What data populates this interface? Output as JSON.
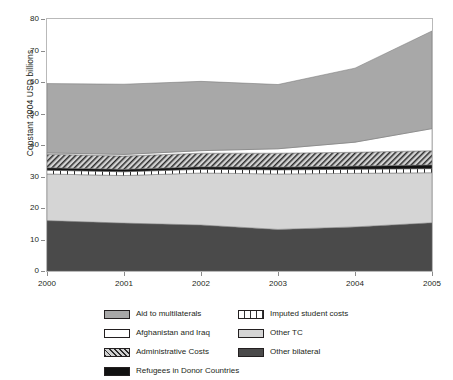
{
  "chart_data": {
    "type": "area",
    "stacked": true,
    "title": "",
    "xlabel": "",
    "ylabel": "Constant 2004 USD billions",
    "x": [
      2000,
      2001,
      2002,
      2003,
      2004,
      2005
    ],
    "xticklabels": [
      "2000",
      "2001",
      "2002",
      "2003",
      "2004",
      "2005"
    ],
    "xlim": [
      2000,
      2005
    ],
    "ylim": [
      0,
      80
    ],
    "yticks": [
      0,
      10,
      20,
      30,
      40,
      50,
      60,
      70,
      80
    ],
    "yticklabels": [
      "0",
      "10",
      "20",
      "30",
      "40",
      "50",
      "60",
      "70",
      "80"
    ],
    "grid": false,
    "legend_position": "bottom",
    "series": [
      {
        "name": "Other bilateral",
        "color": "#4a4a4a",
        "pattern": "solid",
        "values": [
          16.0,
          15.2,
          14.6,
          13.2,
          14.0,
          15.3
        ]
      },
      {
        "name": "Other TC",
        "color": "#d5d5d5",
        "pattern": "solid",
        "values": [
          14.8,
          15.1,
          16.5,
          17.6,
          17.0,
          15.9
        ]
      },
      {
        "name": "Imputed student costs",
        "color": "#ffffff",
        "pattern": "vertical-bars",
        "values": [
          1.2,
          1.2,
          1.2,
          1.3,
          1.3,
          1.3
        ]
      },
      {
        "name": "Refugees in Donor Countries",
        "color": "#111111",
        "pattern": "solid",
        "values": [
          0.8,
          0.8,
          0.8,
          0.9,
          1.0,
          1.2
        ]
      },
      {
        "name": "Administrative Costs",
        "color": "#d0d0d0",
        "pattern": "diagonal-hatch",
        "values": [
          4.3,
          4.2,
          4.3,
          4.4,
          4.4,
          4.5
        ]
      },
      {
        "name": "Afghanistan and Iraq",
        "color": "#ffffff",
        "pattern": "solid",
        "values": [
          0.4,
          0.5,
          0.8,
          1.4,
          3.2,
          7.0
        ]
      },
      {
        "name": "Aid to multilaterals",
        "color": "#a8a8a8",
        "pattern": "solid",
        "values": [
          22.0,
          22.3,
          22.0,
          20.4,
          23.5,
          31.0
        ]
      }
    ],
    "totals": [
      59.5,
      59.3,
      60.2,
      59.2,
      64.4,
      72.2
    ],
    "annotations": []
  },
  "legend": {
    "left_column": [
      {
        "label": "Aid to multilaterals",
        "swatch": "sw-multilaterals"
      },
      {
        "label": "Afghanistan and Iraq",
        "swatch": "sw-afghanistan"
      },
      {
        "label": "Administrative Costs",
        "swatch": "sw-admin"
      },
      {
        "label": "Refugees in Donor Countries",
        "swatch": "sw-refugees"
      }
    ],
    "right_column": [
      {
        "label": "Imputed student costs",
        "swatch": "sw-imputed"
      },
      {
        "label": "Other TC",
        "swatch": "sw-othertc"
      },
      {
        "label": "Other bilateral",
        "swatch": "sw-otherbilateral"
      }
    ]
  }
}
